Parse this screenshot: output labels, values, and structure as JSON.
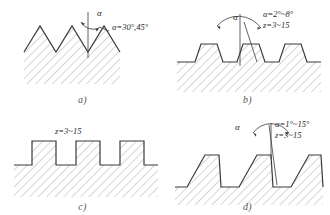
{
  "figure": {
    "background": "#ffffff",
    "line_color": "#3a3a3a",
    "hatch_color": "#8a8a8a"
  },
  "panels": [
    {
      "id": "a",
      "caption": "a)",
      "profile": "triangular",
      "teeth": 3,
      "angle_symbol": "α",
      "angle_label": "α=30°,45°",
      "tooth_count_label": ""
    },
    {
      "id": "b",
      "caption": "b)",
      "profile": "trapezoidal",
      "teeth": 3,
      "angle_symbol": "α",
      "angle_label": "α=2°~8°",
      "tooth_count_label": "z=3~15"
    },
    {
      "id": "c",
      "caption": "c)",
      "profile": "square",
      "teeth": 3,
      "angle_symbol": "",
      "angle_label": "",
      "tooth_count_label": "z=3~15"
    },
    {
      "id": "d",
      "caption": "d)",
      "profile": "buttress",
      "teeth": 3,
      "angle_symbol": "α",
      "angle_label": "α=1°~15°",
      "tooth_count_label": "z=3~15"
    }
  ]
}
